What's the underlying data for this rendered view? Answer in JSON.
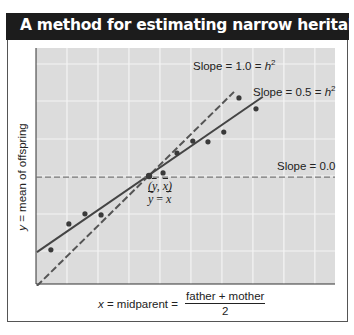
{
  "header": {
    "title": "A method for estimating narrow heritability, ",
    "title_symbol": "h",
    "title_superscript": "2",
    "background": "#1c1c1c",
    "text_color": "#ffffff"
  },
  "axes": {
    "ylabel_var": "y",
    "ylabel_text": " = mean of offspring",
    "xlabel_var": "x",
    "xlabel_text": " = midparent = ",
    "xlabel_numerator": "father + mother",
    "xlabel_denominator": "2"
  },
  "annotations": {
    "slope1": {
      "text": "Slope = 1.0 = ",
      "sym": "h",
      "sup": "2"
    },
    "slope05": {
      "text": "Slope = 0.5 = ",
      "sym": "h",
      "sup": "2"
    },
    "slope0": {
      "text": "Slope = 0.0"
    },
    "mean_point_line1": "(y, x)",
    "mean_point_line2": "y = x"
  },
  "chart_data": {
    "type": "scatter",
    "xlabel": "x = midparent = (father + mother)/2",
    "ylabel": "y = mean of offspring",
    "xlim": [
      0,
      9.65
    ],
    "ylim": [
      0,
      6.29
    ],
    "grid": true,
    "tick_labels": "none",
    "plot_background": "#dcdcdc",
    "grid_color": "#f4f4f4",
    "points": [
      {
        "x": 0.48,
        "y": 0.91
      },
      {
        "x": 1.06,
        "y": 1.6
      },
      {
        "x": 1.58,
        "y": 1.87
      },
      {
        "x": 2.1,
        "y": 1.84
      },
      {
        "x": 3.65,
        "y": 2.88
      },
      {
        "x": 4.1,
        "y": 2.96
      },
      {
        "x": 4.55,
        "y": 3.49
      },
      {
        "x": 5.06,
        "y": 3.81
      },
      {
        "x": 5.55,
        "y": 3.79
      },
      {
        "x": 6.06,
        "y": 4.05
      },
      {
        "x": 6.55,
        "y": 4.96
      },
      {
        "x": 7.1,
        "y": 4.67
      }
    ],
    "mean_point": {
      "x": 3.65,
      "y": 2.88,
      "label": "(ȳ, x̄), ȳ = x̄"
    },
    "lines": [
      {
        "name": "Slope = 1.0 = h^2",
        "style": "dashed",
        "color": "#555555",
        "x": [
          0.03,
          6.39
        ],
        "y": [
          -0.05,
          5.12
        ]
      },
      {
        "name": "Slope = 0.5 = h^2",
        "style": "solid",
        "color": "#444444",
        "x": [
          0.03,
          7.32
        ],
        "y": [
          0.85,
          4.99
        ]
      },
      {
        "name": "Slope = 0.0",
        "style": "dashed",
        "color": "#777777",
        "x": [
          0.0,
          9.65
        ],
        "y": [
          2.85,
          2.85
        ]
      }
    ]
  }
}
